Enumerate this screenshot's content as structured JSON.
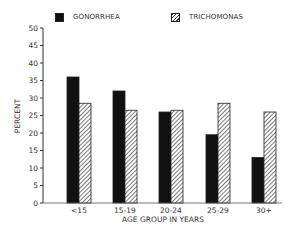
{
  "chart_data": {
    "type": "bar",
    "title": "",
    "xlabel": "AGE GROUP IN YEARS",
    "ylabel": "PERCENT",
    "ylim": [
      0,
      50
    ],
    "yticks": [
      0,
      5,
      10,
      15,
      20,
      25,
      30,
      35,
      40,
      45,
      50
    ],
    "grid": false,
    "legend_position": "top",
    "categories": [
      "<15",
      "15-19",
      "20-24",
      "25-29",
      "30+"
    ],
    "series": [
      {
        "name": "GONORRHEA",
        "style": "solid",
        "color": "#111111",
        "values": [
          36,
          32,
          26,
          19.5,
          13
        ]
      },
      {
        "name": "TRICHOMONAS",
        "style": "hatched",
        "color": "#555555",
        "values": [
          28.5,
          26.5,
          26.5,
          28.5,
          26
        ]
      }
    ]
  },
  "legend": {
    "items": [
      {
        "label": "GONORRHEA"
      },
      {
        "label": "TRICHOMONAS"
      }
    ]
  }
}
